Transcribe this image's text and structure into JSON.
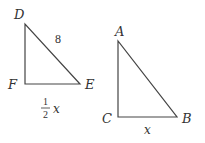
{
  "diagram": {
    "triangles": [
      {
        "name": "DEF",
        "vertices": {
          "D": "D",
          "E": "E",
          "F": "F"
        },
        "right_angle_at": "F",
        "side_labels": {
          "DE": "8",
          "FE_numerator": "1",
          "FE_denominator": "2",
          "FE_var": "x"
        }
      },
      {
        "name": "ABC",
        "vertices": {
          "A": "A",
          "B": "B",
          "C": "C"
        },
        "right_angle_at": "C",
        "side_labels": {
          "CB": "x"
        }
      }
    ],
    "line_color": "#444444"
  }
}
